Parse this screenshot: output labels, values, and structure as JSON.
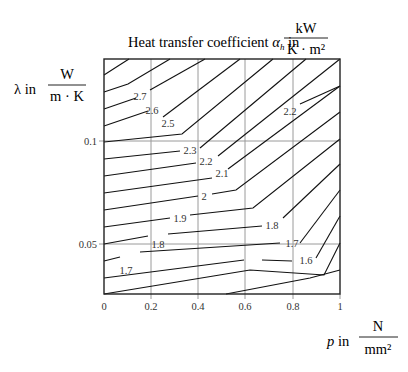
{
  "chart_data": {
    "type": "contour",
    "title_parts": {
      "prefix": "Heat transfer coefficient ",
      "symbol": "α",
      "subscript": "h",
      "suffix": " in",
      "unit_num": "kW",
      "unit_den": "K · m²"
    },
    "xlabel": "p in N/mm²",
    "xlabel_parts": {
      "symbol": "p",
      "suffix": " in",
      "unit_num": "N",
      "unit_den": "mm²"
    },
    "ylabel": "λ in W/(m·K)",
    "ylabel_parts": {
      "symbol": "λ",
      "suffix": " in",
      "unit_num": "W",
      "unit_den": "m · K"
    },
    "xlim": [
      0,
      1
    ],
    "x_ticks": [
      "0",
      "0.2",
      "0.4",
      "0.6",
      "0.8",
      "1"
    ],
    "y_ticks": [
      "0.05",
      "0.1"
    ],
    "grid": true,
    "contour_levels": [
      1.6,
      1.7,
      1.8,
      1.9,
      2.0,
      2.1,
      2.2,
      2.3,
      2.5,
      2.6,
      2.7
    ],
    "contour_labels": [
      {
        "text": "2.7",
        "x": 140,
        "y": 100
      },
      {
        "text": "2.6",
        "x": 152,
        "y": 114
      },
      {
        "text": "2.5",
        "x": 168,
        "y": 127
      },
      {
        "text": "2.3",
        "x": 190,
        "y": 154
      },
      {
        "text": "2.2",
        "x": 206,
        "y": 165
      },
      {
        "text": "2.1",
        "x": 222,
        "y": 177
      },
      {
        "text": "2",
        "x": 204,
        "y": 200
      },
      {
        "text": "1.9",
        "x": 180,
        "y": 222
      },
      {
        "text": "1.8",
        "x": 158,
        "y": 248
      },
      {
        "text": "1.7",
        "x": 126,
        "y": 274
      },
      {
        "text": "2.2",
        "x": 290,
        "y": 115
      },
      {
        "text": "1.8",
        "x": 272,
        "y": 229
      },
      {
        "text": "1.7",
        "x": 292,
        "y": 247
      },
      {
        "text": "1.6",
        "x": 306,
        "y": 264
      }
    ],
    "contours": [
      {
        "points": "104,75 118,66 129,59"
      },
      {
        "points": "104,92 128,84 170,59"
      },
      {
        "points": "104,109 136,98"
      },
      {
        "points": "150,90 205,59"
      },
      {
        "points": "104,126 148,111"
      },
      {
        "points": "163,117 240,59"
      },
      {
        "points": "104,142 182,134 273,59"
      },
      {
        "points": "104,159 180,151"
      },
      {
        "points": "200,148 306,59"
      },
      {
        "points": "104,176 196,163"
      },
      {
        "points": "218,156 340,59"
      },
      {
        "points": "104,193 212,178"
      },
      {
        "points": "228,169 340,86"
      },
      {
        "points": "300,104 340,86"
      },
      {
        "points": "104,210 198,196"
      },
      {
        "points": "212,194 236,190 340,112"
      },
      {
        "points": "104,227 170,218"
      },
      {
        "points": "190,215 253,208 340,139"
      },
      {
        "points": "104,244 148,236"
      },
      {
        "points": "168,234 262,226"
      },
      {
        "points": "283,218 340,164"
      },
      {
        "points": "104,261 120,257"
      },
      {
        "points": "140,252 280,243"
      },
      {
        "points": "300,243 340,190"
      },
      {
        "points": "104,278 244,260"
      },
      {
        "points": "262,260 292,261"
      },
      {
        "points": "316,258 340,216"
      },
      {
        "points": "104,294 250,270 324,275 340,243"
      },
      {
        "points": "226,294 310,278 340,270"
      }
    ]
  }
}
